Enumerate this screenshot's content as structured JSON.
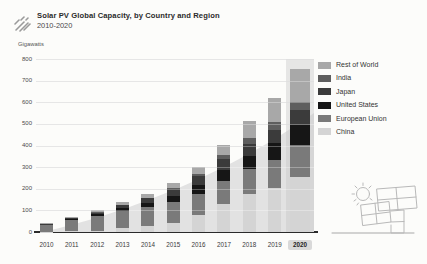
{
  "header": {
    "title": "Solar PV Global Capacity, by Country and Region",
    "subtitle": "2010-2020"
  },
  "axis": {
    "unit_label": "Gigawatts",
    "y_ticks": [
      800,
      700,
      600,
      500,
      400,
      300,
      200,
      100,
      0
    ],
    "y_max": 800
  },
  "highlight_year": "2020",
  "legend": [
    {
      "label": "Rest of World",
      "color": "#a8a8a8"
    },
    {
      "label": "India",
      "color": "#5e5e5e"
    },
    {
      "label": "Japan",
      "color": "#3b3b3b"
    },
    {
      "label": "United States",
      "color": "#161616"
    },
    {
      "label": "European Union",
      "color": "#7a7a7a"
    },
    {
      "label": "China",
      "color": "#d4d4d4"
    }
  ],
  "chart_data": {
    "type": "bar",
    "stacked": true,
    "title": "Solar PV Global Capacity, by Country and Region 2010-2020",
    "xlabel": "",
    "ylabel": "Gigawatts",
    "ylim": [
      0,
      800
    ],
    "grid": true,
    "legend_position": "right",
    "categories": [
      "2010",
      "2011",
      "2012",
      "2013",
      "2014",
      "2015",
      "2016",
      "2017",
      "2018",
      "2019",
      "2020"
    ],
    "series": [
      {
        "name": "China",
        "color": "#d4d4d4",
        "values": [
          1,
          3,
          7,
          19,
          28,
          44,
          77,
          131,
          175,
          204,
          253
        ]
      },
      {
        "name": "European Union",
        "color": "#7a7a7a",
        "values": [
          30,
          52,
          69,
          80,
          87,
          95,
          101,
          107,
          115,
          130,
          151
        ]
      },
      {
        "name": "United States",
        "color": "#161616",
        "values": [
          2.5,
          5,
          7,
          12,
          18,
          26,
          40,
          51,
          62,
          76,
          93
        ]
      },
      {
        "name": "Japan",
        "color": "#3b3b3b",
        "values": [
          3.6,
          5,
          7,
          14,
          23,
          34,
          43,
          49,
          56,
          62,
          67
        ]
      },
      {
        "name": "India",
        "color": "#5e5e5e",
        "values": [
          0.1,
          0.5,
          1,
          2,
          3,
          5,
          9,
          18,
          27,
          35,
          39
        ]
      },
      {
        "name": "Rest of World",
        "color": "#a8a8a8",
        "values": [
          3,
          5,
          9,
          11,
          18,
          23,
          33,
          46,
          77,
          113,
          152
        ]
      }
    ],
    "totals_gw": [
      40,
      70,
      100,
      138,
      177,
      227,
      303,
      402,
      512,
      620,
      755
    ]
  },
  "decor": {
    "wedge_color": "#e2e2e2",
    "icon_color": "#9a9a9a",
    "illustration_stroke": "#b9b9b9"
  }
}
